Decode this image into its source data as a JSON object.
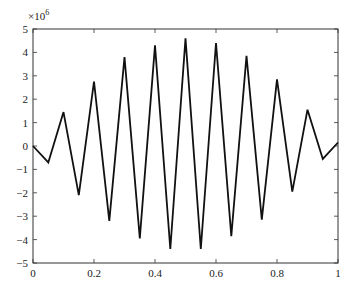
{
  "chart_data": {
    "type": "line",
    "title": "",
    "xlabel": "",
    "ylabel": "",
    "y_multiplier_label": "×10^6",
    "x": [
      0,
      0.05,
      0.1,
      0.15,
      0.2,
      0.25,
      0.3,
      0.35,
      0.4,
      0.45,
      0.5,
      0.55,
      0.6,
      0.65,
      0.7,
      0.75,
      0.8,
      0.85,
      0.9,
      0.95,
      1.0
    ],
    "values": [
      0,
      -0.7,
      1.45,
      -2.1,
      2.75,
      -3.2,
      3.8,
      -3.95,
      4.3,
      -4.4,
      4.6,
      -4.4,
      4.4,
      -3.85,
      3.85,
      -3.15,
      2.85,
      -1.95,
      1.55,
      -0.55,
      0.15
    ],
    "xlim": [
      0,
      1
    ],
    "ylim": [
      -5,
      5
    ],
    "xticks": [
      "0",
      "0.2",
      "0.4",
      "0.6",
      "0.8",
      "1"
    ],
    "yticks": [
      "-5",
      "-4",
      "-3",
      "-2",
      "-1",
      "0",
      "1",
      "2",
      "3",
      "4",
      "5"
    ],
    "grid": false,
    "line_color": "#111111"
  }
}
